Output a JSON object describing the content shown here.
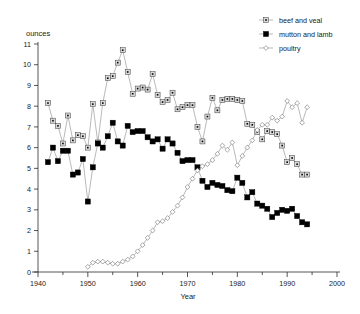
{
  "chart_data": {
    "type": "line",
    "title": "",
    "xlabel": "Year",
    "ylabel": "ounces",
    "xlim": [
      1940,
      2000
    ],
    "ylim": [
      0,
      11
    ],
    "grid": false,
    "legend_position": "top-right",
    "x_ticks": [
      1940,
      1950,
      1960,
      1970,
      1980,
      1990,
      2000
    ],
    "x_minor_ticks": [
      1945,
      1955,
      1965,
      1975,
      1985,
      1995
    ],
    "y_ticks": [
      0,
      1,
      2,
      3,
      4,
      5,
      6,
      7,
      8,
      9,
      10,
      11
    ],
    "series": [
      {
        "name": "beef and veal",
        "marker": "square-dot",
        "marker_fill": "#d9d9d9",
        "x": [
          1942,
          1943,
          1944,
          1945,
          1946,
          1947,
          1948,
          1949,
          1950,
          1951,
          1952,
          1953,
          1954,
          1955,
          1956,
          1957,
          1958,
          1959,
          1960,
          1961,
          1962,
          1963,
          1964,
          1965,
          1966,
          1967,
          1968,
          1969,
          1970,
          1971,
          1972,
          1973,
          1974,
          1975,
          1976,
          1977,
          1978,
          1979,
          1980,
          1981,
          1982,
          1983,
          1984,
          1985,
          1986,
          1987,
          1988,
          1989,
          1990,
          1991,
          1992,
          1993,
          1994
        ],
        "values": [
          8.15,
          7.3,
          7.05,
          6.2,
          7.55,
          6.35,
          6.6,
          6.55,
          6.0,
          8.1,
          6.25,
          8.15,
          9.35,
          9.45,
          10.1,
          10.7,
          9.65,
          8.6,
          8.85,
          8.9,
          8.8,
          9.55,
          8.55,
          8.2,
          8.3,
          8.65,
          7.85,
          7.95,
          8.05,
          8.05,
          7.0,
          6.3,
          7.5,
          8.4,
          7.8,
          8.3,
          8.35,
          8.35,
          8.3,
          8.25,
          7.15,
          7.1,
          6.75,
          6.4,
          6.8,
          6.75,
          6.65,
          6.1,
          5.3,
          5.5,
          5.2,
          4.7,
          4.7
        ]
      },
      {
        "name": "mutton and lamb",
        "marker": "square-filled",
        "marker_fill": "#000000",
        "x": [
          1942,
          1943,
          1944,
          1945,
          1946,
          1947,
          1948,
          1949,
          1950,
          1951,
          1952,
          1953,
          1954,
          1955,
          1956,
          1957,
          1958,
          1959,
          1960,
          1961,
          1962,
          1963,
          1964,
          1965,
          1966,
          1967,
          1968,
          1969,
          1970,
          1971,
          1972,
          1973,
          1974,
          1975,
          1976,
          1977,
          1978,
          1979,
          1980,
          1981,
          1982,
          1983,
          1984,
          1985,
          1986,
          1987,
          1988,
          1989,
          1990,
          1991,
          1992,
          1993,
          1994
        ],
        "values": [
          5.3,
          6.0,
          5.35,
          5.85,
          5.85,
          4.7,
          4.8,
          5.45,
          3.4,
          5.05,
          6.2,
          6.0,
          6.55,
          7.2,
          6.3,
          6.1,
          7.05,
          6.75,
          6.8,
          6.8,
          6.5,
          6.3,
          6.4,
          5.95,
          6.4,
          6.2,
          5.75,
          5.35,
          5.4,
          5.4,
          5.05,
          4.4,
          4.1,
          4.3,
          4.2,
          4.15,
          3.95,
          3.9,
          4.55,
          4.3,
          3.6,
          3.85,
          3.3,
          3.2,
          3.05,
          2.65,
          2.85,
          3.0,
          2.95,
          3.05,
          2.7,
          2.4,
          2.3
        ]
      },
      {
        "name": "poultry",
        "marker": "diamond-open",
        "marker_fill": "#ffffff",
        "x": [
          1950,
          1951,
          1952,
          1953,
          1954,
          1955,
          1956,
          1957,
          1958,
          1959,
          1960,
          1961,
          1962,
          1963,
          1964,
          1965,
          1966,
          1967,
          1968,
          1969,
          1970,
          1971,
          1972,
          1973,
          1974,
          1975,
          1976,
          1977,
          1978,
          1979,
          1980,
          1981,
          1982,
          1983,
          1984,
          1985,
          1986,
          1987,
          1988,
          1989,
          1990,
          1991,
          1992,
          1993,
          1994
        ],
        "values": [
          0.25,
          0.45,
          0.5,
          0.5,
          0.45,
          0.4,
          0.4,
          0.5,
          0.6,
          0.75,
          1.0,
          1.3,
          1.65,
          2.0,
          2.4,
          2.45,
          2.6,
          2.9,
          3.2,
          3.6,
          4.1,
          4.5,
          4.9,
          5.1,
          5.2,
          5.4,
          5.7,
          6.1,
          5.9,
          6.25,
          5.15,
          5.6,
          6.0,
          6.35,
          6.85,
          7.1,
          7.1,
          7.45,
          7.3,
          7.5,
          8.25,
          7.95,
          8.15,
          7.2,
          7.95
        ]
      }
    ]
  },
  "axes": {
    "y_axis_label": "ounces",
    "x_axis_label": "Year",
    "y_tick_labels": [
      "0",
      "1",
      "2",
      "3",
      "4",
      "5",
      "6",
      "7",
      "8",
      "9",
      "10",
      "11"
    ],
    "x_tick_labels": [
      "1940",
      "1950",
      "1960",
      "1970",
      "1980",
      "1990",
      "2000"
    ]
  },
  "legend": {
    "entries": [
      {
        "label": "beef and veal",
        "marker": "square-dot"
      },
      {
        "label": "mutton and lamb",
        "marker": "square-filled"
      },
      {
        "label": "poultry",
        "marker": "diamond-open"
      }
    ]
  },
  "colors": {
    "line": "#8a8a8a",
    "axis": "#2b2b2b",
    "text": "#1a1a1a",
    "beef_fill": "#d9d9d9",
    "mutton_fill": "#000000",
    "poultry_fill": "#ffffff",
    "background": "#ffffff"
  }
}
